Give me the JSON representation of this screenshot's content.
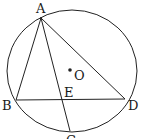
{
  "diagram": {
    "type": "circle-geometry",
    "circle": {
      "cx": 72,
      "cy": 71,
      "rx": 65,
      "ry": 61,
      "center_label": "O"
    },
    "points": {
      "A": {
        "x": 41,
        "y": 18,
        "label": "A"
      },
      "B": {
        "x": 16,
        "y": 100,
        "label": "B"
      },
      "C": {
        "x": 70,
        "y": 131,
        "label": "C"
      },
      "D": {
        "x": 125,
        "y": 99,
        "label": "D"
      },
      "E": {
        "x": 63,
        "y": 99,
        "label": "E"
      },
      "O": {
        "x": 70,
        "y": 70,
        "label": "O"
      }
    },
    "segments": [
      "AB",
      "AD",
      "AC",
      "BD"
    ],
    "line_color": "#222222"
  }
}
